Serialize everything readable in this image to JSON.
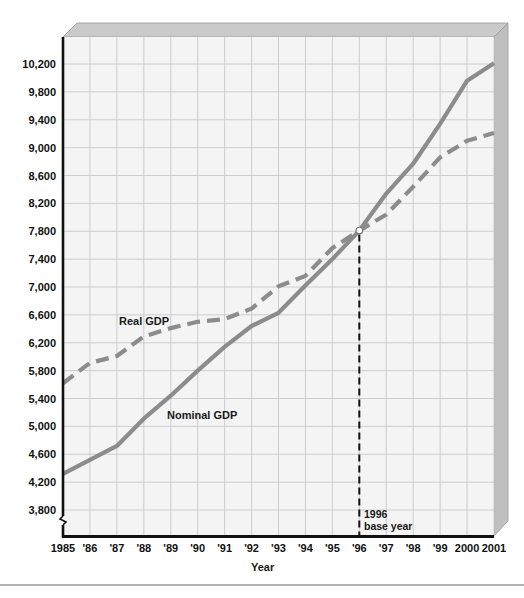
{
  "chart_data": {
    "type": "line",
    "title": "",
    "xlabel": "Year",
    "ylabel": "",
    "x": [
      "1985",
      "'86",
      "'87",
      "'88",
      "'89",
      "'90",
      "'91",
      "'92",
      "'93",
      "'94",
      "'95",
      "'96",
      "'97",
      "'98",
      "'99",
      "2000",
      "2001"
    ],
    "years": [
      1985,
      1986,
      1987,
      1988,
      1989,
      1990,
      1991,
      1992,
      1993,
      1994,
      1995,
      1996,
      1997,
      1998,
      1999,
      2000,
      2001
    ],
    "series": [
      {
        "name": "Nominal GDP",
        "style": "solid",
        "color": "#8c8c8c",
        "values": [
          4320,
          4520,
          4720,
          5110,
          5440,
          5800,
          6140,
          6440,
          6630,
          7020,
          7400,
          7810,
          8340,
          8770,
          9340,
          9960,
          10210
        ]
      },
      {
        "name": "Real GDP",
        "style": "dashed",
        "color": "#8c8c8c",
        "values": [
          5620,
          5910,
          6010,
          6290,
          6410,
          6500,
          6540,
          6690,
          7010,
          7160,
          7560,
          7810,
          8040,
          8440,
          8860,
          9100,
          9210
        ]
      }
    ],
    "yticks": [
      "10,200",
      "9,800",
      "9,400",
      "9,000",
      "8,600",
      "8,200",
      "7,800",
      "7,400",
      "7,000",
      "6,600",
      "6,200",
      "5,800",
      "5,400",
      "5,000",
      "4,600",
      "4,200",
      "3,800"
    ],
    "ytick_values": [
      10200,
      9800,
      9400,
      9000,
      8600,
      8200,
      7800,
      7400,
      7000,
      6600,
      6200,
      5800,
      5400,
      5000,
      4600,
      4200,
      3800
    ],
    "ylim": [
      3400,
      10560
    ],
    "grid": true,
    "axis_break": true,
    "legend": "inline labels",
    "annotations": [
      {
        "text": "Real GDP",
        "target": "Real GDP"
      },
      {
        "text": "Nominal GDP",
        "target": "Nominal GDP"
      },
      {
        "text": "1996",
        "text2": "base year",
        "x": 1996,
        "marker_value": 7810
      }
    ]
  },
  "labels": {
    "real": "Real GDP",
    "nominal": "Nominal GDP",
    "base_year_1": "1996",
    "base_year_2": "base year",
    "xlabel": "Year"
  },
  "colors": {
    "line": "#8c8c8c",
    "grid": "#c8c8c8",
    "plot_bg": "#f4f4f4",
    "bevel_top": "#c9c9c9",
    "bevel_side": "#bdbdbd",
    "axis": "#111111"
  }
}
